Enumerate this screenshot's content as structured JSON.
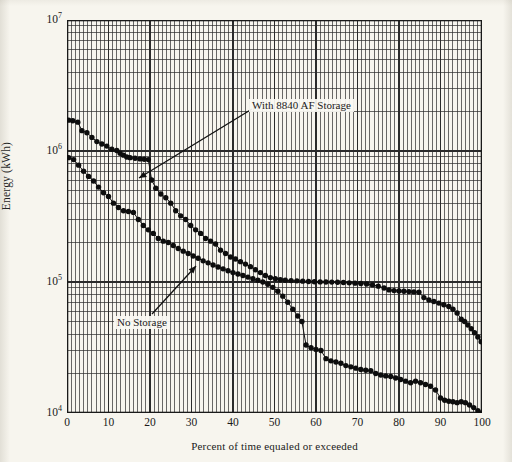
{
  "figure": {
    "background_color": "#f7f5ee",
    "ink_color": "#1a1a1a"
  },
  "chart_data": {
    "type": "line",
    "title": "",
    "xlabel": "Percent of time equaled or exceeded",
    "ylabel": "Energy (kWh)",
    "xlim": [
      0,
      100
    ],
    "ylim": [
      10000,
      10000000
    ],
    "yscale": "log",
    "xscale": "linear",
    "grid": true,
    "grid_minor": true,
    "legend": "none (curves labeled by in-plot annotations with leader lines)",
    "xticks": [
      0,
      10,
      20,
      30,
      40,
      50,
      60,
      70,
      80,
      90,
      100
    ],
    "xtick_labels": [
      "0",
      "10",
      "20",
      "30",
      "40",
      "50",
      "60",
      "70",
      "80",
      "90",
      "100"
    ],
    "yticks": [
      10000,
      100000,
      1000000,
      10000000
    ],
    "ytick_labels": [
      "10⁴",
      "10⁵",
      "10⁶",
      "10⁷"
    ],
    "ytick_mantissas": [
      "4",
      "5",
      "6",
      "7"
    ],
    "marker": "filled circle",
    "series": [
      {
        "name": "With 8840 AF Storage",
        "annotation": "With 8840 AF Storage",
        "points": [
          [
            0.4,
            1720000
          ],
          [
            1.4,
            1700000
          ],
          [
            2.6,
            1660000
          ],
          [
            3.6,
            1430000
          ],
          [
            4.8,
            1380000
          ],
          [
            6.0,
            1270000
          ],
          [
            7.2,
            1180000
          ],
          [
            8.4,
            1130000
          ],
          [
            9.6,
            1090000
          ],
          [
            10.8,
            1030000
          ],
          [
            12.0,
            1010000
          ],
          [
            12.8,
            960000
          ],
          [
            13.6,
            930000
          ],
          [
            14.4,
            900000
          ],
          [
            15.2,
            890000
          ],
          [
            16.4,
            880000
          ],
          [
            17.6,
            870000
          ],
          [
            18.6,
            865000
          ],
          [
            19.6,
            860000
          ],
          [
            20.4,
            600000
          ],
          [
            21.4,
            520000
          ],
          [
            22.6,
            470000
          ],
          [
            23.8,
            440000
          ],
          [
            25.0,
            400000
          ],
          [
            26.2,
            350000
          ],
          [
            27.4,
            320000
          ],
          [
            28.6,
            300000
          ],
          [
            29.8,
            270000
          ],
          [
            31.0,
            250000
          ],
          [
            32.2,
            235000
          ],
          [
            33.4,
            215000
          ],
          [
            34.6,
            205000
          ],
          [
            35.8,
            195000
          ],
          [
            37.0,
            175000
          ],
          [
            38.2,
            165000
          ],
          [
            39.4,
            155000
          ],
          [
            40.6,
            150000
          ],
          [
            41.8,
            143000
          ],
          [
            43.0,
            137000
          ],
          [
            44.2,
            131000
          ],
          [
            45.4,
            124000
          ],
          [
            46.6,
            118000
          ],
          [
            47.8,
            112000
          ],
          [
            49.0,
            108000
          ],
          [
            50.2,
            106000
          ],
          [
            51.4,
            104000
          ],
          [
            52.6,
            103000
          ],
          [
            54.0,
            102500
          ],
          [
            55.4,
            102000
          ],
          [
            56.8,
            101500
          ],
          [
            58.2,
            101000
          ],
          [
            59.6,
            100500
          ],
          [
            61.0,
            100200
          ],
          [
            62.4,
            100000
          ],
          [
            63.8,
            99800
          ],
          [
            65.2,
            99500
          ],
          [
            66.6,
            99000
          ],
          [
            68.0,
            98500
          ],
          [
            69.4,
            98000
          ],
          [
            70.8,
            97500
          ],
          [
            72.2,
            96500
          ],
          [
            73.6,
            95000
          ],
          [
            75.0,
            93000
          ],
          [
            76.4,
            90000
          ],
          [
            77.6,
            87000
          ],
          [
            78.8,
            86000
          ],
          [
            80.0,
            85500
          ],
          [
            81.2,
            85000
          ],
          [
            82.4,
            84500
          ],
          [
            83.6,
            84000
          ],
          [
            84.8,
            83500
          ],
          [
            86.0,
            76000
          ],
          [
            87.2,
            73000
          ],
          [
            88.4,
            71000
          ],
          [
            89.6,
            69000
          ],
          [
            90.8,
            67000
          ],
          [
            92.0,
            65000
          ],
          [
            93.0,
            62000
          ],
          [
            94.0,
            58000
          ],
          [
            95.0,
            52000
          ],
          [
            95.8,
            50000
          ],
          [
            96.6,
            47000
          ],
          [
            97.4,
            44000
          ],
          [
            98.2,
            41000
          ],
          [
            99.0,
            38000
          ],
          [
            99.8,
            35000
          ]
        ]
      },
      {
        "name": "No Storage",
        "annotation": "No Storage",
        "points": [
          [
            0.4,
            890000
          ],
          [
            1.6,
            860000
          ],
          [
            2.8,
            780000
          ],
          [
            4.0,
            700000
          ],
          [
            5.2,
            640000
          ],
          [
            6.4,
            590000
          ],
          [
            7.6,
            530000
          ],
          [
            8.8,
            480000
          ],
          [
            10.0,
            450000
          ],
          [
            11.2,
            400000
          ],
          [
            12.4,
            370000
          ],
          [
            13.6,
            350000
          ],
          [
            14.8,
            345000
          ],
          [
            16.0,
            340000
          ],
          [
            17.2,
            300000
          ],
          [
            18.4,
            270000
          ],
          [
            19.6,
            250000
          ],
          [
            20.8,
            235000
          ],
          [
            22.0,
            215000
          ],
          [
            23.2,
            205000
          ],
          [
            24.4,
            200000
          ],
          [
            25.6,
            190000
          ],
          [
            26.8,
            180000
          ],
          [
            28.0,
            172000
          ],
          [
            29.2,
            165000
          ],
          [
            30.4,
            158000
          ],
          [
            31.6,
            152000
          ],
          [
            32.8,
            145000
          ],
          [
            34.0,
            140000
          ],
          [
            35.2,
            135000
          ],
          [
            36.4,
            130000
          ],
          [
            37.6,
            126000
          ],
          [
            38.8,
            122000
          ],
          [
            40.0,
            118000
          ],
          [
            41.2,
            115000
          ],
          [
            42.4,
            112000
          ],
          [
            43.6,
            109000
          ],
          [
            44.8,
            106000
          ],
          [
            46.0,
            103000
          ],
          [
            47.2,
            100000
          ],
          [
            48.4,
            96000
          ],
          [
            49.6,
            91000
          ],
          [
            50.8,
            85000
          ],
          [
            52.0,
            78000
          ],
          [
            53.2,
            70000
          ],
          [
            54.4,
            62000
          ],
          [
            55.6,
            55000
          ],
          [
            56.6,
            50000
          ],
          [
            57.6,
            33000
          ],
          [
            58.8,
            31500
          ],
          [
            60.0,
            30500
          ],
          [
            61.2,
            30000
          ],
          [
            62.4,
            26000
          ],
          [
            63.6,
            25000
          ],
          [
            64.8,
            24500
          ],
          [
            66.0,
            24000
          ],
          [
            67.2,
            23000
          ],
          [
            68.4,
            22500
          ],
          [
            69.6,
            22000
          ],
          [
            70.8,
            21500
          ],
          [
            72.0,
            21200
          ],
          [
            73.2,
            21000
          ],
          [
            74.4,
            20000
          ],
          [
            75.6,
            19500
          ],
          [
            76.8,
            19200
          ],
          [
            78.0,
            19000
          ],
          [
            79.2,
            18500
          ],
          [
            80.4,
            18000
          ],
          [
            81.6,
            17500
          ],
          [
            82.8,
            17000
          ],
          [
            84.0,
            17500
          ],
          [
            85.2,
            17000
          ],
          [
            86.4,
            16500
          ],
          [
            87.6,
            16000
          ],
          [
            88.8,
            15000
          ],
          [
            90.0,
            13000
          ],
          [
            91.0,
            12500
          ],
          [
            92.0,
            12300
          ],
          [
            93.0,
            12200
          ],
          [
            94.0,
            12000
          ],
          [
            95.0,
            12200
          ],
          [
            96.0,
            12000
          ],
          [
            97.0,
            11500
          ],
          [
            98.0,
            11000
          ],
          [
            99.0,
            10400
          ],
          [
            99.8,
            10000
          ]
        ]
      }
    ],
    "annotations": [
      {
        "text": "With 8840 AF Storage",
        "label_x": 249,
        "label_y": 99,
        "leader_from_x": 252,
        "leader_from_y": 109,
        "leader_to_x": 139,
        "leader_to_y": 178
      },
      {
        "text": "No Storage",
        "label_x": 114,
        "label_y": 316,
        "leader_from_x": 152,
        "leader_from_y": 314,
        "leader_to_x": 196,
        "leader_to_y": 266
      }
    ]
  }
}
